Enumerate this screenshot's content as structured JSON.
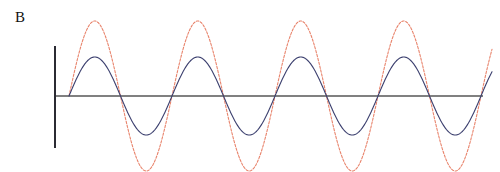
{
  "figure": {
    "panel_label": "B",
    "background_color": "#ffffff"
  },
  "axes": {
    "x_axis": {
      "name": "horizontal-axis",
      "color": "#808080",
      "y_pixel": 96,
      "x_start_pixel": 55,
      "x_end_pixel": 483,
      "stroke_width": 2
    },
    "y_axis": {
      "name": "vertical-axis",
      "color": "#2b2b33",
      "x_pixel": 55,
      "y_top_pixel": 46,
      "y_bottom_pixel": 148,
      "stroke_width": 2
    }
  },
  "chart_data": {
    "type": "line",
    "title": "B",
    "xlabel": "",
    "ylabel": "",
    "grid": false,
    "legend": "none",
    "xlim": [
      0,
      500
    ],
    "ylim": [
      -1.2,
      1.2
    ],
    "x_zero_crossing_pixel": 69,
    "period_pixels": 103,
    "baseline_pixel": 96,
    "series": [
      {
        "name": "large-amplitude-wave",
        "color": "#e8836b",
        "style": "dashed",
        "stroke_width": 1.1,
        "amplitude_pixels": 75,
        "amplitude_normalized": 1.0,
        "phase": 0,
        "peak_top_pixel": 21,
        "trough_bottom_pixel": 171,
        "peak_x_pixels": [
          94,
          197,
          300,
          403
        ],
        "trough_x_pixels": [
          146,
          249,
          352,
          455
        ],
        "zero_crossings_pixels": [
          69,
          120,
          172,
          224,
          275,
          327,
          378,
          430,
          481
        ]
      },
      {
        "name": "small-amplitude-wave",
        "color": "#3b3f6e",
        "style": "solid",
        "stroke_width": 1.1,
        "amplitude_pixels": 39,
        "amplitude_normalized": 0.52,
        "phase": 0,
        "peak_top_pixel": 57,
        "trough_bottom_pixel": 135,
        "peak_x_pixels": [
          94,
          197,
          300,
          403
        ],
        "trough_x_pixels": [
          146,
          249,
          352,
          455
        ],
        "zero_crossings_pixels": [
          69,
          120,
          172,
          224,
          275,
          327,
          378,
          430,
          481
        ]
      }
    ],
    "cycles_visible": 4.1
  }
}
